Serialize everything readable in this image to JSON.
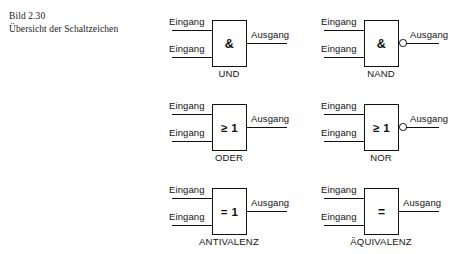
{
  "figure": {
    "caption_lines": [
      "Bild 2.30",
      "Übersicht der Schaltzeichen"
    ],
    "ink_color": "#111111",
    "background_color": "#ffffff"
  },
  "labels": {
    "input": "Eingang",
    "output": "Ausgang"
  },
  "gates": [
    {
      "name": "UND",
      "symbol": "&",
      "inverted_output": false,
      "inputs": [
        "Eingang",
        "Eingang"
      ],
      "output": "Ausgang",
      "row": 0,
      "column": 0
    },
    {
      "name": "NAND",
      "symbol": "&",
      "inverted_output": true,
      "inputs": [
        "Eingang",
        "Eingang"
      ],
      "output": "Ausgang",
      "row": 0,
      "column": 1
    },
    {
      "name": "ODER",
      "symbol": "≥ 1",
      "inverted_output": false,
      "inputs": [
        "Eingang",
        "Eingang"
      ],
      "output": "Ausgang",
      "row": 1,
      "column": 0
    },
    {
      "name": "NOR",
      "symbol": "≥ 1",
      "inverted_output": true,
      "inputs": [
        "Eingang",
        "Eingang"
      ],
      "output": "Ausgang",
      "row": 1,
      "column": 1
    },
    {
      "name": "ANTIVALENZ",
      "symbol": "= 1",
      "inverted_output": false,
      "inputs": [
        "Eingang",
        "Eingang"
      ],
      "output": "Ausgang",
      "row": 2,
      "column": 0
    },
    {
      "name": "ÄQUIVALENZ",
      "symbol": "=",
      "inverted_output": false,
      "inputs": [
        "Eingang",
        "Eingang"
      ],
      "output": "Ausgang",
      "row": 2,
      "column": 1
    }
  ]
}
